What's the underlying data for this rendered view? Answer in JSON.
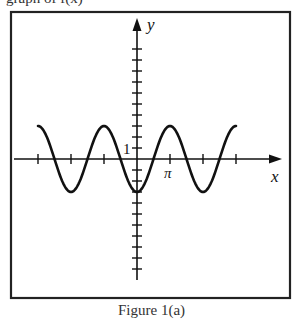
{
  "caption_top_fragment": "graph of f(x)",
  "caption_bottom_fragment": "Figure 1(a)",
  "chart_data": {
    "type": "line",
    "title": "",
    "xlabel": "x",
    "ylabel": "y",
    "function": "y = -3cos(x)",
    "xlim": [
      -3.14159,
      3.14159
    ],
    "x_domain_plotted_in_pi": [
      -3,
      3
    ],
    "x_tick_spacing": "π",
    "x_tick_labels": [
      {
        "value_in_pi": 1,
        "label": "π"
      }
    ],
    "y_tick_spacing": 1,
    "y_tick_labels": [
      {
        "value": 1,
        "label": "1"
      }
    ],
    "y_range_ticks": [
      -10,
      10
    ],
    "grid": false,
    "legend": null,
    "series": [
      {
        "name": "f(x)",
        "x_in_pi": [
          -3,
          -2.5,
          -2,
          -1.5,
          -1,
          -0.5,
          0,
          0.5,
          1,
          1.5,
          2,
          2.5,
          3
        ],
        "values": [
          3,
          0,
          -3,
          0,
          3,
          0,
          -3,
          0,
          3,
          0,
          -3,
          0,
          3
        ]
      }
    ],
    "colors": {
      "axis": "#111111",
      "curve": "#111111",
      "frame": "#222222"
    }
  },
  "layout": {
    "frame": {
      "left": 11,
      "top": 12,
      "right": 290,
      "bottom": 298
    },
    "origin": {
      "x": 137,
      "y": 159
    },
    "px_per_pi": 33,
    "px_per_unit_y": 11,
    "x_axis": {
      "from": 14,
      "to": 282
    },
    "y_axis": {
      "from": 280,
      "to": 18
    },
    "x_ticks_in_pi": [
      -3,
      -2,
      -1,
      1,
      2,
      3
    ],
    "y_ticks": [
      -10,
      -9,
      -8,
      -7,
      -6,
      -5,
      -4,
      -3,
      -2,
      -1,
      1,
      2,
      3,
      4,
      5,
      6,
      7,
      8,
      9,
      10
    ]
  }
}
